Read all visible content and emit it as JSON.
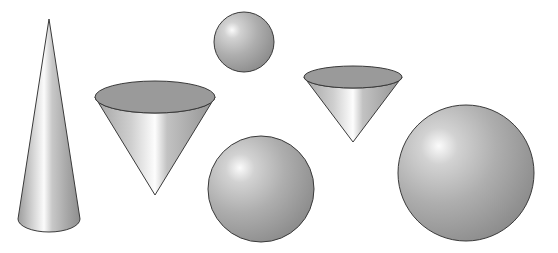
{
  "scene": {
    "title": "Geometric solids: cones and spheres",
    "background": "#ffffff",
    "stroke": "#3a3a3a",
    "colors": {
      "highlight": "#f4f4f4",
      "mid": "#b8b8b8",
      "shadow": "#8a8a8a",
      "cap": "#9a9a9a"
    },
    "shapes": [
      {
        "type": "cone-upright",
        "label": "Tall cone",
        "apex": [
          49,
          19
        ],
        "base_center": [
          49,
          219
        ],
        "rx": 31,
        "ry": 13
      },
      {
        "type": "cone-inverted",
        "label": "Wide inverted cone",
        "top_center": [
          155,
          97
        ],
        "rx": 60,
        "ry": 16,
        "apex": [
          155,
          195
        ]
      },
      {
        "type": "sphere",
        "label": "Small sphere",
        "center": [
          244,
          42
        ],
        "r": 30
      },
      {
        "type": "cone-inverted",
        "label": "Small inverted cone",
        "top_center": [
          353,
          77
        ],
        "rx": 49,
        "ry": 11,
        "apex": [
          353,
          142
        ]
      },
      {
        "type": "sphere",
        "label": "Medium sphere",
        "center": [
          261,
          189
        ],
        "r": 53
      },
      {
        "type": "sphere",
        "label": "Large sphere",
        "center": [
          466,
          173
        ],
        "r": 68
      }
    ]
  }
}
